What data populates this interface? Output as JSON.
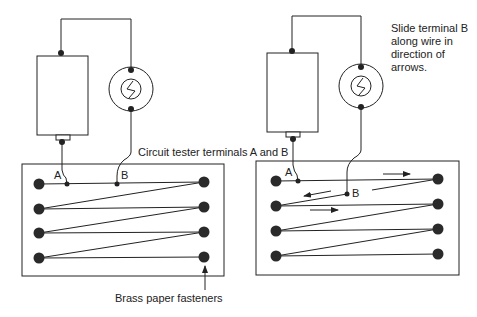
{
  "captions": {
    "terminals": "Circuit tester terminals A and B",
    "fasteners": "Brass paper fasteners",
    "instruction_lines": [
      "Slide terminal B",
      "along wire in",
      "direction of",
      "arrows."
    ]
  },
  "left_panel": {
    "terminal_a": "A",
    "terminal_b": "B",
    "components": [
      "battery",
      "bulb",
      "board",
      "fasteners"
    ]
  },
  "right_panel": {
    "terminal_a": "A",
    "terminal_b": "B",
    "arrows": [
      "right",
      "left",
      "right"
    ]
  },
  "colors": {
    "line": "#222222",
    "background": "#ffffff"
  }
}
